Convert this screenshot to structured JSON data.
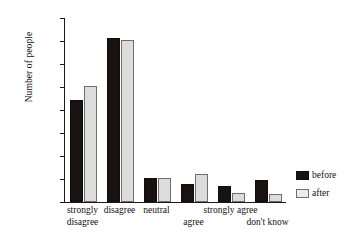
{
  "chart_data": {
    "type": "bar",
    "title": "",
    "xlabel": "",
    "ylabel": "Number of people",
    "ylim": [
      0,
      160
    ],
    "ytick_values": [
      0,
      20,
      40,
      60,
      80,
      100,
      120,
      140,
      160
    ],
    "ytick_labels": [
      "0",
      "20",
      "40",
      "60",
      "80",
      "100",
      "120",
      "140",
      "160"
    ],
    "grid": false,
    "legend_position": "right",
    "categories": [
      "strongly disagree",
      "disagree",
      "neutral",
      "agree",
      "strongly agree",
      "don't know"
    ],
    "category_lines": [
      [
        "strongly",
        "disagree"
      ],
      [
        "disagree",
        ""
      ],
      [
        "neutral",
        ""
      ],
      [
        "",
        "agree"
      ],
      [
        "strongly agree",
        ""
      ],
      [
        "",
        "don't know"
      ]
    ],
    "series": [
      {
        "name": "before",
        "color": "#1a1210",
        "values": [
          89,
          143,
          21,
          16,
          14,
          19
        ]
      },
      {
        "name": "after",
        "color": "#dcdcdc",
        "values": [
          101,
          141,
          21,
          24,
          8,
          7
        ]
      }
    ]
  },
  "axis": {
    "y_title": "Number of people"
  },
  "legend": {
    "items": [
      {
        "label": "before"
      },
      {
        "label": "after"
      }
    ]
  },
  "colors": {
    "before": "#1a1210",
    "after": "#dcdcdc",
    "axis": "#1a1a1a",
    "background": "#ffffff"
  }
}
